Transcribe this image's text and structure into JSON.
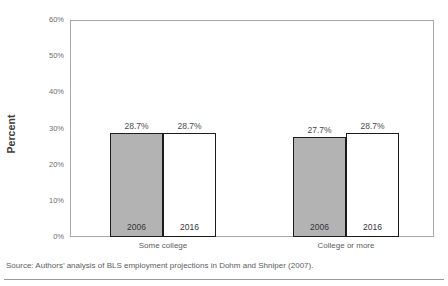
{
  "chart_data": {
    "type": "bar",
    "title": "",
    "xlabel": "",
    "ylabel": "Percent",
    "ylim": [
      0,
      60
    ],
    "y_tick_labels": [
      "0%",
      "10%",
      "20%",
      "30%",
      "40%",
      "50%",
      "60%"
    ],
    "y_tick_values": [
      0,
      10,
      20,
      30,
      40,
      50,
      60
    ],
    "grid": false,
    "legend_position": "none",
    "categories": [
      "Some college",
      "College or more"
    ],
    "series": [
      {
        "name": "2006",
        "values": [
          28.7,
          27.7
        ],
        "value_labels": [
          "28.7%",
          "27.7%"
        ],
        "color": "#b3b3b3"
      },
      {
        "name": "2016",
        "values": [
          28.7,
          28.7
        ],
        "value_labels": [
          "28.7%",
          "28.7%"
        ],
        "color": "#ffffff"
      }
    ],
    "bar_outline_color": "#1c1c1c"
  },
  "source": {
    "text": "Source: Authors’ analysis of BLS employment projections in Dohm and Shniper (2007)."
  }
}
